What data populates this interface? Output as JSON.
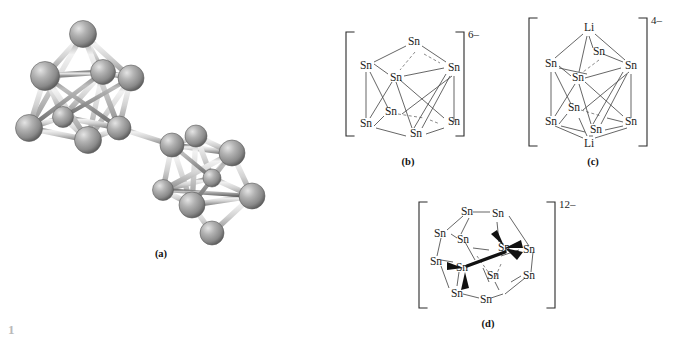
{
  "figure": {
    "background_color": "#ffffff",
    "sphere_color": "#9a9a9a",
    "bond_color": "#d8d8d8",
    "line_color": "#4a4a4a",
    "partial_caption": "1"
  },
  "panels": [
    {
      "id": "a",
      "label": "(a)",
      "type": "ball-and-stick-3d",
      "description": "two linked polyhedral tin cluster cages rendered as grey spheres joined by pale cylindrical bonds"
    },
    {
      "id": "b",
      "label": "(b)",
      "type": "line-diagram",
      "charge": "6–",
      "atom_labels": [
        "Sn",
        "Sn",
        "Sn",
        "Sn",
        "Sn",
        "Sn",
        "Sn",
        "Sn"
      ],
      "atom_count": 8,
      "geometry": "square antiprism"
    },
    {
      "id": "c",
      "label": "(c)",
      "type": "line-diagram",
      "charge": "4–",
      "atom_labels": [
        "Li",
        "Sn",
        "Sn",
        "Sn",
        "Sn",
        "Sn",
        "Sn",
        "Sn",
        "Sn",
        "Li"
      ],
      "atom_count": 10,
      "geometry": "square antiprism capped by two lithium atoms"
    },
    {
      "id": "d",
      "label": "(d)",
      "type": "line-diagram",
      "charge": "12–",
      "atom_labels": [
        "Sn",
        "Sn",
        "Sn",
        "Sn",
        "Sn",
        "Sn",
        "Sn",
        "Sn",
        "Sn",
        "Sn",
        "Sn",
        "Sn"
      ],
      "atom_count": 12,
      "geometry": "icosahedral cage drawn with bold wedge bonds"
    }
  ],
  "atoms": {
    "tin": "Sn",
    "lithium": "Li"
  },
  "charges": {
    "b": "6–",
    "c": "4–",
    "d": "12–"
  },
  "labels": {
    "a": "(a)",
    "b": "(b)",
    "c": "(c)",
    "d": "(d)"
  }
}
